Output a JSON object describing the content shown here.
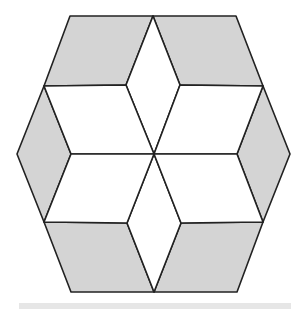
{
  "figure": {
    "stroke_color": "#222222",
    "shaded_fill": "#d4d4d4",
    "unshaded_fill": "#ffffff",
    "stroke_width": 1.6,
    "center": [
      154,
      154
    ],
    "shapes": [
      {
        "name": "rhombus-top-left-shaded",
        "points": "70,16 153,16 126,85 44,86",
        "shaded": true
      },
      {
        "name": "rhombus-top-right-shaded",
        "points": "153,16 236,16 263,86 180,85",
        "shaded": true
      },
      {
        "name": "rhombus-left-shaded",
        "points": "44,86 71,154 44,222 17,154",
        "shaded": true
      },
      {
        "name": "rhombus-right-shaded",
        "points": "263,86 290,154 263,222 237,154",
        "shaded": true
      },
      {
        "name": "rhombus-bottom-left-shaded",
        "points": "44,222 127,223 154,292 71,292",
        "shaded": true
      },
      {
        "name": "rhombus-bottom-right-shaded",
        "points": "181,223 263,222 237,292 154,292",
        "shaded": true
      },
      {
        "name": "rhombus-top-center-white",
        "points": "153,16 180,85 154,154 126,85",
        "shaded": false
      },
      {
        "name": "rhombus-bottom-center-white",
        "points": "154,154 181,223 154,292 127,223",
        "shaded": false
      },
      {
        "name": "rhombus-upper-left-white",
        "points": "44,86 126,85 154,154 71,154",
        "shaded": false
      },
      {
        "name": "rhombus-upper-right-white",
        "points": "180,85 263,86 237,154 154,154",
        "shaded": false
      },
      {
        "name": "rhombus-lower-left-white",
        "points": "71,154 154,154 127,223 44,222",
        "shaded": false
      },
      {
        "name": "rhombus-lower-right-white",
        "points": "154,154 237,154 263,222 181,223",
        "shaded": false
      }
    ]
  },
  "footer_bar": {
    "color": "#e6e6e6"
  }
}
